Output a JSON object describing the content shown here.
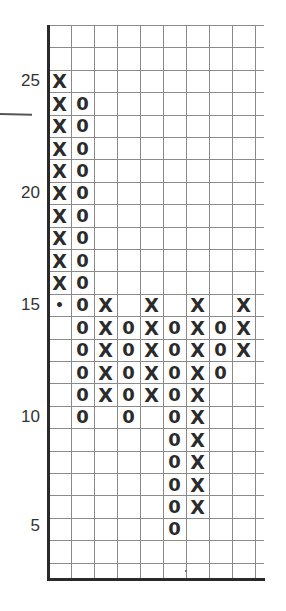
{
  "chart_data": {
    "type": "point-and-figure",
    "title": "",
    "xlabel": "",
    "ylabel": "",
    "box_size": 1,
    "ylim": [
      3,
      27
    ],
    "y_tick_labels": [
      "25",
      "20",
      "15",
      "10",
      "5"
    ],
    "y_ticks": [
      25,
      20,
      15,
      10,
      5
    ],
    "grid": true,
    "columns": [
      {
        "index": 0,
        "type": "X",
        "from": 16,
        "to": 25
      },
      {
        "index": 1,
        "type": "O",
        "from": 24,
        "to": 10
      },
      {
        "index": 2,
        "type": "X",
        "from": 11,
        "to": 15
      },
      {
        "index": 3,
        "type": "O",
        "from": 14,
        "to": 10
      },
      {
        "index": 4,
        "type": "X",
        "from": 11,
        "to": 15
      },
      {
        "index": 5,
        "type": "O",
        "from": 14,
        "to": 5
      },
      {
        "index": 6,
        "type": "X",
        "from": 6,
        "to": 15
      },
      {
        "index": 7,
        "type": "O",
        "from": 14,
        "to": 12
      },
      {
        "index": 8,
        "type": "X",
        "from": 13,
        "to": 15
      }
    ],
    "annotations": [
      {
        "type": "dot",
        "column": 0,
        "value": 15
      },
      {
        "type": "line",
        "description": "short horizontal line left of axis near 24"
      }
    ],
    "num_grid_columns": 10
  },
  "labels": {
    "y25": "25",
    "y20": "20",
    "y15": "15",
    "y10": "10",
    "y5": "5"
  },
  "symbols": {
    "x": "X",
    "o": "0",
    "dot": "•"
  },
  "colors": {
    "ink": "#2b2b2b",
    "grid": "#8a8a8a",
    "axis": "#2a2a2a",
    "background": "#ffffff"
  }
}
